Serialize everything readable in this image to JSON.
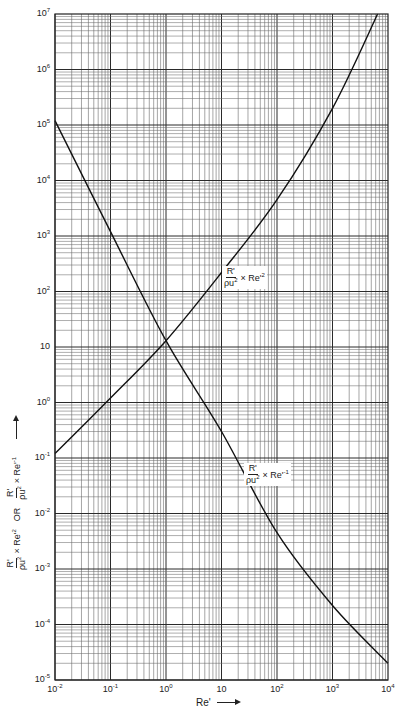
{
  "chart_data": {
    "type": "line",
    "title": "",
    "xscale": "log",
    "yscale": "log",
    "xlim": [
      0.01,
      10000
    ],
    "ylim": [
      1e-05,
      10000000
    ],
    "grid": true,
    "xlabel": "Re'",
    "ylabel": "R'/ρu² × Re'² OR R'/ρu² × Re'⁻¹",
    "x_ticks": [
      "10^-2",
      "10^-1",
      "10^0",
      "10",
      "10^2",
      "10^3",
      "10^4"
    ],
    "y_ticks": [
      "10^7",
      "10^6",
      "10^5",
      "10^4",
      "10^3",
      "10^2",
      "10",
      "10^0",
      "10^-1",
      "10^-2",
      "10^-3",
      "10^-4",
      "10^-5"
    ],
    "series": [
      {
        "name": "R'/ρu² × Re'²",
        "x": [
          0.01,
          0.1,
          1,
          10,
          100,
          1000,
          6500
        ],
        "values": [
          0.12,
          1.2,
          13,
          220,
          4500,
          200000,
          10000000
        ]
      },
      {
        "name": "R'/ρu² × Re'⁻¹",
        "x": [
          0.01,
          0.1,
          1,
          10,
          100,
          1000,
          10000
        ],
        "values": [
          120000,
          1200,
          13,
          0.3,
          0.0045,
          0.00022,
          2e-05
        ]
      }
    ],
    "annotations": [
      {
        "text": "R'/ρu² × Re'²",
        "near_x": 30,
        "near_y": 1000
      },
      {
        "text": "R'/ρu² × Re'⁻¹",
        "near_x": 60,
        "near_y": 0.05
      }
    ]
  },
  "axes": {
    "x_ticks": [
      {
        "base": "10",
        "exp": "-2"
      },
      {
        "base": "10",
        "exp": "-1"
      },
      {
        "base": "10",
        "exp": "0"
      },
      {
        "base": "10",
        "exp": ""
      },
      {
        "base": "10",
        "exp": "2"
      },
      {
        "base": "10",
        "exp": "3"
      },
      {
        "base": "10",
        "exp": "4"
      }
    ],
    "y_ticks": [
      {
        "base": "10",
        "exp": "7"
      },
      {
        "base": "10",
        "exp": "6"
      },
      {
        "base": "10",
        "exp": "5"
      },
      {
        "base": "10",
        "exp": "4"
      },
      {
        "base": "10",
        "exp": "3"
      },
      {
        "base": "10",
        "exp": "2"
      },
      {
        "base": "10",
        "exp": ""
      },
      {
        "base": "10",
        "exp": "0"
      },
      {
        "base": "10",
        "exp": "-1"
      },
      {
        "base": "10",
        "exp": "-2"
      },
      {
        "base": "10",
        "exp": "-3"
      },
      {
        "base": "10",
        "exp": "-4"
      },
      {
        "base": "10",
        "exp": "-5"
      }
    ],
    "xlabel": "Re'",
    "ylabel": {
      "num": "R'",
      "den": "ρu",
      "den_exp": "2",
      "part1_suffix": "× Re'",
      "part1_exp": "2",
      "or": "OR",
      "part2_suffix": "× Re'",
      "part2_exp": "-1"
    }
  },
  "labels": {
    "re2": {
      "num": "R'",
      "den": "ρu",
      "den_exp": "2",
      "suffix": "× Re'",
      "exp": "2"
    },
    "re_inv": {
      "num": "R'",
      "den": "ρu",
      "den_exp": "2",
      "suffix": "× Re'",
      "exp": "-1"
    }
  },
  "colors": {
    "grid_major": "#2a2a2a",
    "grid_minor": "#6a6a6a",
    "curve": "#111111",
    "background": "#ffffff"
  }
}
